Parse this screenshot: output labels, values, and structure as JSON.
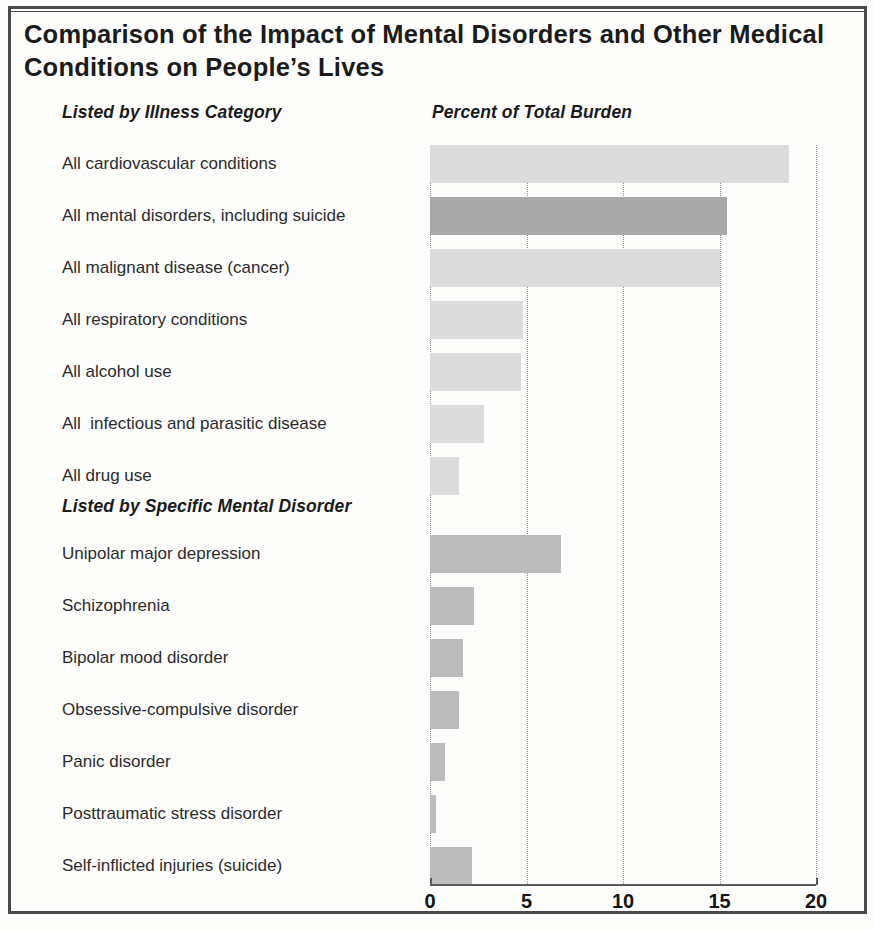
{
  "title": "Comparison of the Impact of Mental Disorders and Other Medical Conditions on People’s Lives",
  "headers": {
    "left_column": "Listed by Illness Category",
    "value_column": "Percent of Total Burden",
    "section2": "Listed by Specific Mental Disorder"
  },
  "colors": {
    "bar_other": "#dcdcdc",
    "bar_mental_highlight": "#a9a9a9",
    "bar_specific_mental": "#bcbcbc",
    "axis": "#5a5a5a",
    "gridline": "#8c8c8c",
    "frame": "#4a4a4a",
    "text": "#2b2b2b",
    "title_text": "#1b1b1b"
  },
  "chart_data": {
    "type": "bar",
    "orientation": "horizontal",
    "title": "Comparison of the Impact of Mental Disorders and Other Medical Conditions on People’s Lives",
    "xlabel": "Percent of Total Burden",
    "ylabel": "",
    "xlim": [
      0,
      20
    ],
    "xticks": [
      0,
      5,
      10,
      15,
      20
    ],
    "xtick_labels": [
      "0",
      "5",
      "10",
      "15",
      "20"
    ],
    "grid": "vertical dotted gridlines at 5, 10, 15, 20",
    "legend": "none",
    "sections": [
      {
        "name": "Listed by Illness Category",
        "categories": [
          "All cardiovascular conditions",
          "All mental disorders, including suicide",
          "All malignant disease (cancer)",
          "All respiratory conditions",
          "All alcohol use",
          "All  infectious and parasitic disease",
          "All drug use"
        ],
        "values": [
          18.6,
          15.4,
          15.0,
          4.8,
          4.7,
          2.8,
          1.5
        ],
        "highlight_index": 1
      },
      {
        "name": "Listed by Specific Mental Disorder",
        "categories": [
          "Unipolar major depression",
          "Schizophrenia",
          "Bipolar mood disorder",
          "Obsessive-compulsive disorder",
          "Panic disorder",
          "Posttraumatic stress disorder",
          "Self-inflicted injuries (suicide)"
        ],
        "values": [
          6.8,
          2.3,
          1.7,
          1.5,
          0.8,
          0.3,
          2.2
        ],
        "highlight_index": null
      }
    ]
  }
}
